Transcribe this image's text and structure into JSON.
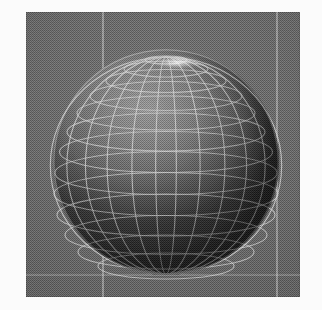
{
  "render": {
    "title": "3D wireframe sphere render",
    "subject": "sphere",
    "style": "shaded wireframe globe",
    "colorspace": "grayscale / dithered"
  },
  "viewport": {
    "background_color": "#686868",
    "frame_color": "#5d5d5d",
    "margin_color": "#ffffff",
    "x": 26,
    "y": 12,
    "width": 274,
    "height": 285,
    "guides": {
      "vertical": [
        {
          "name": "guide-line-left",
          "x": 76,
          "color": "#ebebeb"
        },
        {
          "name": "guide-line-right",
          "x": 250,
          "color": "#ebebeb"
        }
      ],
      "horizontal": [
        {
          "name": "guide-line-bottom",
          "y": 262,
          "color": "#ebebeb"
        }
      ]
    }
  },
  "sphere": {
    "name": "wireframe-sphere",
    "center_x": 140,
    "center_y": 150,
    "radius": 113,
    "wire_color": "#d8d8d8",
    "surface_light": "#8d8d8d",
    "surface_dark": "#3a3a3a",
    "light_direction": "upper-left",
    "meridian_count": 16,
    "parallel_count": 13,
    "pole_visible": "north",
    "pole_highlight": true
  }
}
